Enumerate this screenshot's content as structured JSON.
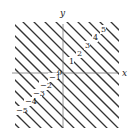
{
  "diagram": {
    "title": "",
    "function": "f(x,y) = x + y level curves",
    "axes": {
      "x_label": "x",
      "y_label": "y",
      "origin_label": "0"
    },
    "level_labels": [
      {
        "value": "5",
        "x": 101,
        "y": 32
      },
      {
        "value": "4",
        "x": 93,
        "y": 40
      },
      {
        "value": "3",
        "x": 85,
        "y": 48
      },
      {
        "value": "2",
        "x": 77,
        "y": 56
      },
      {
        "value": "1",
        "x": 69,
        "y": 64
      },
      {
        "value": "−1",
        "x": 49,
        "y": 80
      },
      {
        "value": "−2",
        "x": 40,
        "y": 88
      },
      {
        "value": "−3",
        "x": 33,
        "y": 96
      },
      {
        "value": "−4",
        "x": 25,
        "y": 104
      },
      {
        "value": "−5",
        "x": 16,
        "y": 113
      }
    ],
    "colors": {
      "lines": "#333333",
      "axes": "#666666",
      "background": "#ffffff"
    }
  },
  "chart_data": {
    "type": "contour",
    "title": "",
    "xlabel": "x",
    "ylabel": "y",
    "levels": [
      -5,
      -4,
      -3,
      -2,
      -1,
      0,
      1,
      2,
      3,
      4,
      5
    ],
    "labeled_levels": [
      -5,
      -4,
      -3,
      -2,
      -1,
      1,
      2,
      3,
      4,
      5
    ],
    "equation": "x + y = c",
    "grid": false
  }
}
